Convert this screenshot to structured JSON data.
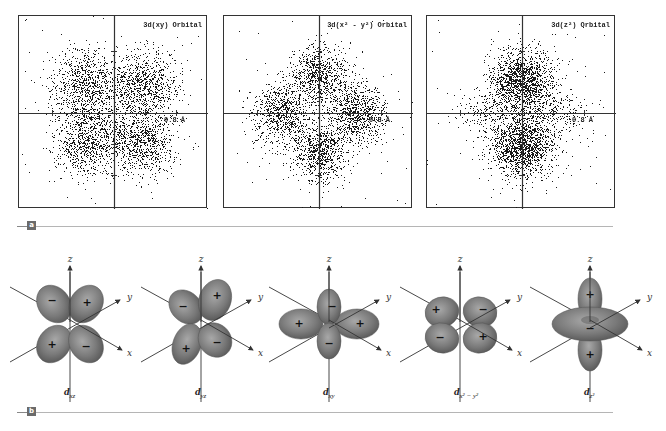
{
  "panel_a": {
    "badge": "a",
    "plots": [
      {
        "title": "3d(xy) Orbital",
        "tick_label": "0.8 Å",
        "x": 18,
        "y": 15,
        "w": 189,
        "h": 193,
        "ax": 95,
        "ay": 97,
        "lobes": [
          [
            -28,
            -28,
            17
          ],
          [
            28,
            -28,
            17
          ],
          [
            -28,
            28,
            17
          ],
          [
            28,
            28,
            17
          ]
        ],
        "points_per_lobe": 900,
        "seed": 7
      },
      {
        "title": "3d(x² - y²) Orbital",
        "tick_label": "0.8 Å",
        "x": 223,
        "y": 15,
        "w": 189,
        "h": 193,
        "ax": 95,
        "ay": 97,
        "lobes": [
          [
            0,
            -38,
            15
          ],
          [
            0,
            38,
            15
          ],
          [
            -38,
            0,
            15
          ],
          [
            38,
            0,
            15
          ]
        ],
        "points_per_lobe": 800,
        "seed": 11
      },
      {
        "title": "3d(z²) Orbital",
        "tick_label": "0.8 Å",
        "x": 426,
        "y": 15,
        "w": 189,
        "h": 193,
        "ax": 95,
        "ay": 97,
        "lobes": [
          [
            0,
            -32,
            15
          ],
          [
            0,
            32,
            15
          ]
        ],
        "ring": {
          "r": 32,
          "sigma": 12,
          "count": 450
        },
        "points_per_lobe": 1500,
        "seed": 23
      }
    ]
  },
  "panel_b": {
    "badge": "b",
    "axis_labels": {
      "x": "x",
      "y": "y",
      "z": "z"
    },
    "orbitals": [
      {
        "name": "dxz",
        "label_main": "d",
        "label_sub": "xz",
        "cx": 70,
        "type": "dxz",
        "signs": [
          "−",
          "+",
          "+",
          "−"
        ]
      },
      {
        "name": "dyz",
        "label_main": "d",
        "label_sub": "yz",
        "cx": 201,
        "type": "dyz",
        "signs": [
          "−",
          "+",
          "+",
          "−"
        ]
      },
      {
        "name": "dxy",
        "label_main": "d",
        "label_sub": "xy",
        "cx": 329,
        "type": "dxy",
        "signs": [
          "+",
          "−",
          "+",
          "−"
        ]
      },
      {
        "name": "dx2-y2",
        "label_main": "d",
        "label_sub": "x² − y²",
        "cx": 460,
        "type": "dx2y2",
        "signs": [
          "+",
          "−",
          "−",
          "+"
        ]
      },
      {
        "name": "dz2",
        "label_main": "d",
        "label_sub": "z²",
        "cx": 590,
        "type": "dz2",
        "signs": [
          "+",
          "−",
          "+"
        ]
      }
    ]
  },
  "colors": {
    "lobe": "#7a7a7a",
    "lobe_dark": "#555555",
    "lobe_light": "#a8a8a8",
    "axis": "#333333",
    "dots": "#1a1a1a"
  }
}
